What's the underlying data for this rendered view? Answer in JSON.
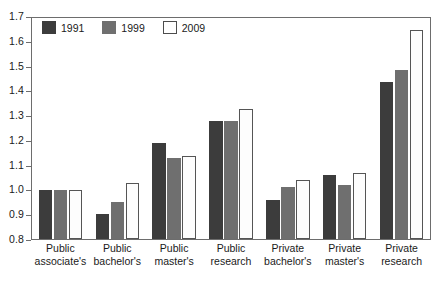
{
  "chart_data": {
    "type": "bar",
    "title": "",
    "subtitle": "",
    "xlabel": "",
    "ylabel": "",
    "ylim": [
      0.8,
      1.7
    ],
    "ytick_labels": [
      "1.7",
      "1.6",
      "1.5",
      "1.4",
      "1.3",
      "1.2",
      "1.1",
      "1.0",
      "0.9",
      "0.8"
    ],
    "ytick_values": [
      1.7,
      1.6,
      1.5,
      1.4,
      1.3,
      1.2,
      1.1,
      1.0,
      0.9,
      0.8
    ],
    "grid": false,
    "legend_position": "top-left",
    "categories": [
      [
        "Public",
        "associate's"
      ],
      [
        "Public",
        "bachelor's"
      ],
      [
        "Public",
        "master's"
      ],
      [
        "Public",
        "research"
      ],
      [
        "Private",
        "bachelor's"
      ],
      [
        "Private",
        "master's"
      ],
      [
        "Private",
        "research"
      ]
    ],
    "category_labels": [
      "Public associate's",
      "Public bachelor's",
      "Public master's",
      "Public research",
      "Private bachelor's",
      "Private master's",
      "Private research"
    ],
    "series": [
      {
        "name": "1991",
        "color": "#3c3c3c",
        "values": [
          1.0,
          0.9,
          1.19,
          1.28,
          0.96,
          1.06,
          1.44
        ]
      },
      {
        "name": "1999",
        "color": "#6f6f6f",
        "values": [
          1.0,
          0.95,
          1.13,
          1.28,
          1.01,
          1.02,
          1.49
        ]
      },
      {
        "name": "2009",
        "color": "#ffffff",
        "values": [
          1.0,
          1.03,
          1.14,
          1.33,
          1.04,
          1.07,
          1.65
        ]
      }
    ]
  },
  "legend": {
    "items": [
      {
        "label": "1991"
      },
      {
        "label": "1999"
      },
      {
        "label": "2009"
      }
    ]
  }
}
